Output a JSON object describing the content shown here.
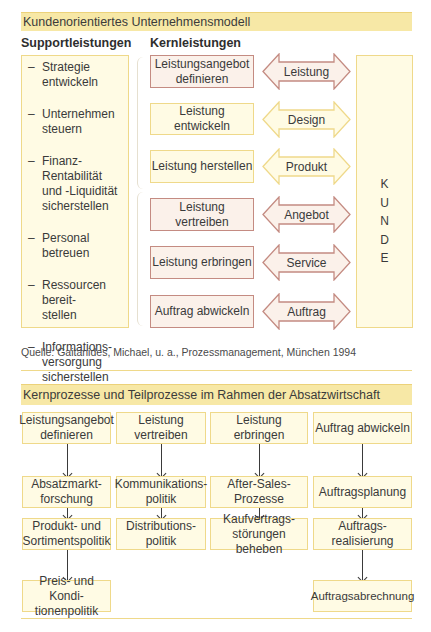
{
  "model": {
    "title": "Kundenorientiertes Unternehmensmodell",
    "support_heading": "Supportleistungen",
    "core_heading": "Kernleistungen",
    "support_items": [
      "Strategie\nentwickeln",
      "Unternehmen\nsteuern",
      "Finanz-Rentabilität\nund -Liquidität\nsicherstellen",
      "Personal betreuen",
      "Ressourcen bereit-\nstellen",
      "Informations-\nversorgung\nsicherstellen"
    ],
    "core_rows": [
      {
        "process": "Leistungsangebot\ndefinieren",
        "exchange": "Leistung",
        "style": "red"
      },
      {
        "process": "Leistung entwickeln",
        "exchange": "Design",
        "style": "yellow"
      },
      {
        "process": "Leistung herstellen",
        "exchange": "Produkt",
        "style": "yellow"
      },
      {
        "process": "Leistung vertreiben",
        "exchange": "Angebot",
        "style": "red"
      },
      {
        "process": "Leistung erbringen",
        "exchange": "Service",
        "style": "red"
      },
      {
        "process": "Auftrag abwickeln",
        "exchange": "Auftrag",
        "style": "red"
      }
    ],
    "customer_letters": [
      "K",
      "U",
      "N",
      "D",
      "E"
    ],
    "source": "Quelle: Gaitanides, Michael, u. a., Prozessmanagement, München 1994"
  },
  "processes": {
    "title": "Kernprozesse und Teilprozesse im Rahmen der Absatzwirtschaft",
    "columns": [
      {
        "core": "Leistungsangebot\ndefinieren",
        "sub": [
          "Absatzmarkt-\nforschung",
          "Produkt- und\nSortimentspolitik",
          "Preis- und Kondi-\ntionenpolitik"
        ]
      },
      {
        "core": "Leistung\nvertreiben",
        "sub": [
          "Kommunikations-\npolitik",
          "Distributions-\npolitik"
        ]
      },
      {
        "core": "Leistung\nerbringen",
        "sub": [
          "After-Sales-\nProzesse",
          "Kaufvertrags-\nstörungen beheben"
        ]
      },
      {
        "core": "Auftrag abwickeln",
        "sub": [
          "Auftragsplanung",
          "Auftrags-\nrealisierung",
          "Auftragsabrechnung"
        ]
      }
    ]
  },
  "colors": {
    "header_fill": "#f7e8a6",
    "yellow_box_fill": "#fffbe4",
    "yellow_box_border": "#efd98a",
    "red_box_fill": "#fbf1ea",
    "red_box_border": "#c48b82"
  }
}
